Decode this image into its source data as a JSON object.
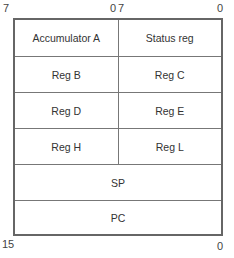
{
  "bit_labels": {
    "top": {
      "left_high": "7",
      "left_low": "0",
      "right_high": "7",
      "right_low": "0"
    },
    "bottom": {
      "high": "15",
      "low": "0"
    }
  },
  "registers": {
    "rows": [
      {
        "left": "Accumulator A",
        "right": "Status reg"
      },
      {
        "left": "Reg B",
        "right": "Reg C"
      },
      {
        "left": "Reg D",
        "right": "Reg E"
      },
      {
        "left": "Reg H",
        "right": "Reg L"
      }
    ],
    "wide": [
      "SP",
      "PC"
    ]
  }
}
